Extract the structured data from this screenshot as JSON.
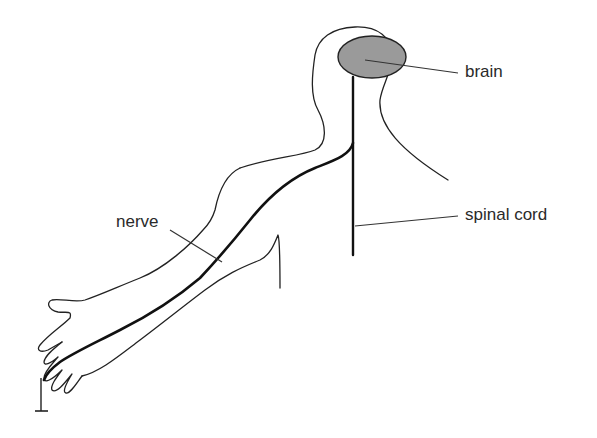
{
  "diagram": {
    "type": "anatomy-nervous-system",
    "labels": {
      "brain": "brain",
      "spinal_cord": "spinal cord",
      "nerve": "nerve"
    },
    "colors": {
      "brain_fill": "#9a9a9a",
      "line": "#222222",
      "background": "#ffffff"
    }
  }
}
